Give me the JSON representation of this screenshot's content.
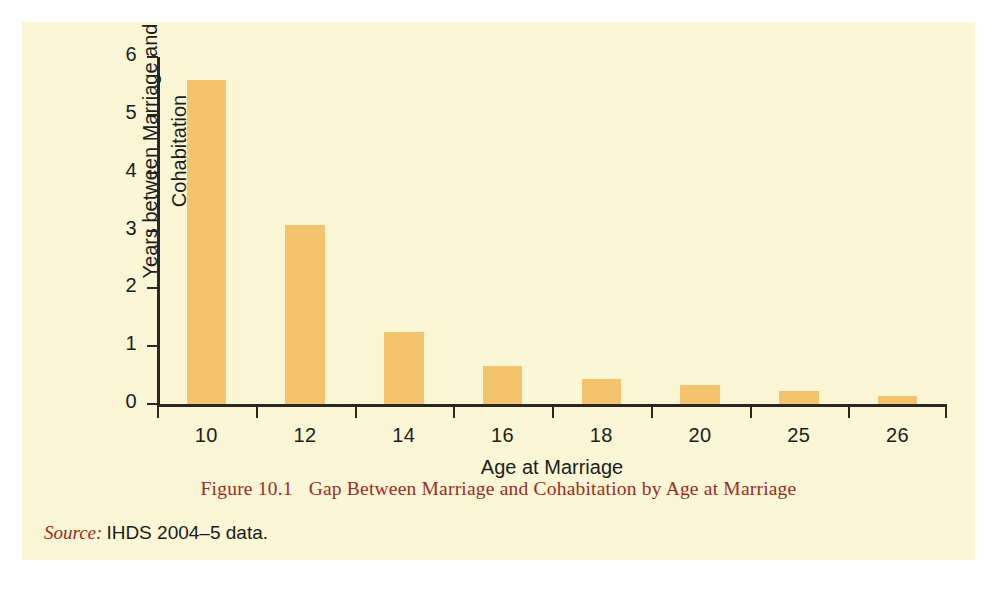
{
  "figure": {
    "caption_number": "Figure 10.1",
    "caption_text": "Gap Between Marriage and Cohabitation by Age at Marriage",
    "source_label": "Source:",
    "source_text": "IHDS 2004–5 data.",
    "panel_background": "#faf6d6",
    "caption_color": "#9e2b21",
    "bar_color": "#f3c46c",
    "axis_color": "#2b2722"
  },
  "chart_data": {
    "type": "bar",
    "title": "Gap Between Marriage and Cohabitation by Age at Marriage",
    "xlabel": "Age at Marriage",
    "ylabel": "Years between Marriage and Cohabitation",
    "ylabel_line1": "Years between Marriage and",
    "ylabel_line2": "Cohabitation",
    "categories": [
      "10",
      "12",
      "14",
      "16",
      "18",
      "20",
      "25",
      "26"
    ],
    "values": [
      5.6,
      3.1,
      1.25,
      0.66,
      0.43,
      0.32,
      0.22,
      0.14
    ],
    "ylim": [
      0,
      6
    ],
    "yticks": [
      0,
      1,
      2,
      3,
      4,
      5,
      6
    ],
    "ytick_labels": [
      "0",
      "1",
      "2",
      "3",
      "4",
      "5",
      "6"
    ],
    "grid": false,
    "legend": false,
    "series": [
      {
        "name": "Years between Marriage and Cohabitation",
        "color": "#f3c46c",
        "values": [
          5.6,
          3.1,
          1.25,
          0.66,
          0.43,
          0.32,
          0.22,
          0.14
        ]
      }
    ]
  }
}
